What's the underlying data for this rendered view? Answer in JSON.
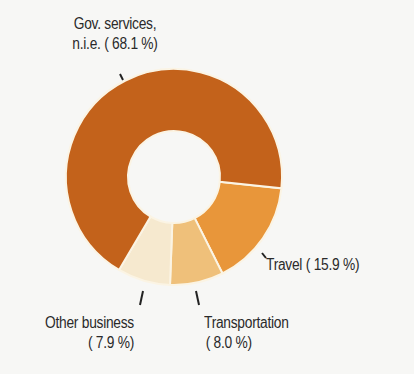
{
  "chart_data": {
    "type": "pie",
    "subtype": "donut",
    "title": "",
    "slices": [
      {
        "label": "Travel",
        "value": 15.9,
        "display": "Travel ( 15.9 %)",
        "color": "#e8963a"
      },
      {
        "label": "Transportation",
        "value": 8.0,
        "display_lines": [
          "Transportation",
          "( 8.0 %)"
        ],
        "color": "#efc07a"
      },
      {
        "label": "Other business",
        "value": 7.9,
        "display_lines": [
          "Other business",
          "( 7.9 %)"
        ],
        "color": "#f6e9cf"
      },
      {
        "label": "Gov. services, n.i.e.",
        "value": 68.1,
        "display_lines": [
          "Gov. services,",
          "n.i.e. ( 68.1 %)"
        ],
        "color": "#c3621b"
      }
    ],
    "start_direction": "just below 3 o'clock",
    "direction": "clockwise",
    "legend": "none",
    "separator_color": "#fbf4e4"
  }
}
